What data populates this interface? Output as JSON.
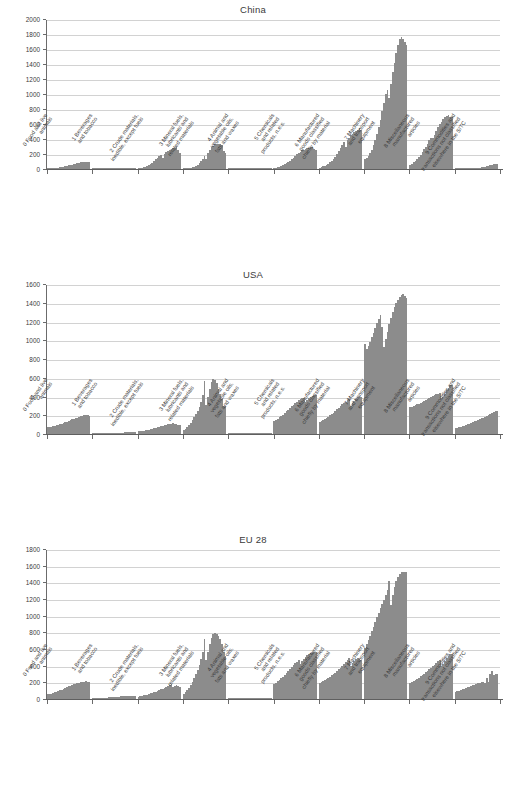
{
  "figure": {
    "bar_color": "#8c8c8c",
    "grid_color": "#d2d2d2",
    "axis_color": "#6b6b6b",
    "text_color": "#3a3a3a"
  },
  "categories": [
    "0 Food and live\nanimals",
    "1 Beverages\nand tobacco",
    "2 Crude materials,\ninedible, except fuels",
    "3 Mineral fuels,\nlubricants and\nrelated materials",
    "4 Animal and\nvegetable oils,\nfats and waxes",
    "5 Chemicals\nand related\nproducts, n.e.s.",
    "6 Manufactured\ngoods classified\nchiefly by material",
    "7 Machinery\nand transport\nequipment",
    "8 Miscellaneous\nmanufactured\narticles",
    "9 Commodities and\ntransactions not classified\nelsewhere in the SITC"
  ],
  "chart_data": [
    {
      "type": "bar",
      "title": "China",
      "xlabel": "",
      "ylabel": "",
      "ylim": [
        0,
        2000
      ],
      "yticks": [
        0,
        200,
        400,
        600,
        800,
        1000,
        1200,
        1400,
        1600,
        1800,
        2000
      ],
      "grid": true,
      "legend": "none",
      "categories": [
        "0 Food and live animals",
        "1 Beverages and tobacco",
        "2 Crude materials, inedible, except fuels",
        "3 Mineral fuels, lubricants and related materials",
        "4 Animal and vegetable oils, fats and waxes",
        "5 Chemicals and related products, n.e.s.",
        "6 Manufactured goods classified chiefly by material",
        "7 Machinery and transport equipment",
        "8 Miscellaneous manufactured articles",
        "9 Commodities and transactions not classified elsewhere in the SITC"
      ],
      "groups": [
        {
          "category": "0 Food and live animals",
          "values": [
            8,
            10,
            12,
            14,
            16,
            18,
            20,
            24,
            28,
            32,
            36,
            42,
            48,
            54,
            60,
            66,
            72,
            78,
            84,
            88,
            92,
            94,
            96,
            94,
            92
          ]
        },
        {
          "category": "1 Beverages and tobacco",
          "values": [
            1,
            1,
            1,
            2,
            2,
            2,
            2,
            3,
            3,
            3,
            4,
            4,
            5,
            5,
            6,
            6,
            7,
            7,
            8,
            8,
            9,
            9,
            10,
            10,
            10
          ]
        },
        {
          "category": "2 Crude materials, inedible, except fuels",
          "values": [
            10,
            14,
            18,
            24,
            30,
            40,
            52,
            66,
            84,
            104,
            128,
            150,
            168,
            190,
            150,
            205,
            230,
            245,
            255,
            265,
            275,
            285,
            290,
            250,
            215
          ]
        },
        {
          "category": "3 Mineral fuels, lubricants and related materials",
          "values": [
            6,
            8,
            10,
            14,
            18,
            24,
            32,
            44,
            60,
            80,
            105,
            135,
            170,
            140,
            215,
            255,
            290,
            310,
            330,
            340,
            335,
            330,
            320,
            240,
            215
          ]
        },
        {
          "category": "4 Animal and vegetable oils, fats and waxes",
          "values": [
            1,
            1,
            1,
            2,
            2,
            2,
            3,
            3,
            4,
            4,
            5,
            6,
            6,
            7,
            8,
            8,
            9,
            10,
            10,
            11,
            11,
            12,
            12,
            11,
            10
          ]
        },
        {
          "category": "5 Chemicals and related products, n.e.s.",
          "values": [
            15,
            20,
            25,
            32,
            40,
            50,
            62,
            76,
            92,
            110,
            130,
            150,
            172,
            195,
            215,
            232,
            248,
            260,
            268,
            275,
            282,
            288,
            292,
            270,
            255
          ]
        },
        {
          "category": "6 Manufactured goods classified chiefly by material",
          "values": [
            20,
            26,
            34,
            44,
            56,
            70,
            88,
            110,
            136,
            166,
            200,
            238,
            278,
            318,
            355,
            300,
            390,
            420,
            450,
            470,
            490,
            505,
            520,
            545,
            520
          ]
        },
        {
          "category": "7 Machinery and transport equipment",
          "values": [
            130,
            150,
            180,
            215,
            260,
            320,
            390,
            470,
            560,
            660,
            770,
            880,
            1000,
            1060,
            950,
            1130,
            1290,
            1420,
            1550,
            1660,
            1730,
            1760,
            1740,
            1700,
            1660
          ]
        },
        {
          "category": "8 Miscellaneous manufactured articles",
          "values": [
            55,
            70,
            90,
            110,
            135,
            162,
            192,
            225,
            262,
            300,
            340,
            382,
            420,
            410,
            460,
            510,
            555,
            595,
            630,
            665,
            690,
            710,
            725,
            700,
            690
          ]
        },
        {
          "category": "9 Commodities and transactions not classified elsewhere in the SITC",
          "values": [
            2,
            2,
            3,
            3,
            4,
            4,
            5,
            6,
            7,
            8,
            10,
            12,
            14,
            17,
            20,
            24,
            28,
            33,
            38,
            44,
            50,
            56,
            62,
            66,
            68
          ]
        }
      ]
    },
    {
      "type": "bar",
      "title": "USA",
      "xlabel": "",
      "ylabel": "",
      "ylim": [
        0,
        1600
      ],
      "yticks": [
        0,
        200,
        400,
        600,
        800,
        1000,
        1200,
        1400,
        1600
      ],
      "grid": true,
      "legend": "none",
      "categories": [
        "0 Food and live animals",
        "1 Beverages and tobacco",
        "2 Crude materials, inedible, except fuels",
        "3 Mineral fuels, lubricants and related materials",
        "4 Animal and vegetable oils, fats and waxes",
        "5 Chemicals and related products, n.e.s.",
        "6 Manufactured goods classified chiefly by material",
        "7 Machinery and transport equipment",
        "8 Miscellaneous manufactured articles",
        "9 Commodities and transactions not classified elsewhere in the SITC"
      ],
      "groups": [
        {
          "category": "0 Food and live animals",
          "values": [
            70,
            75,
            80,
            85,
            90,
            95,
            100,
            105,
            112,
            118,
            125,
            132,
            140,
            148,
            155,
            162,
            168,
            175,
            182,
            190,
            196,
            200,
            205,
            200,
            196
          ]
        },
        {
          "category": "1 Beverages and tobacco",
          "values": [
            4,
            5,
            5,
            6,
            6,
            7,
            7,
            8,
            8,
            9,
            9,
            10,
            11,
            12,
            13,
            14,
            15,
            16,
            17,
            18,
            19,
            20,
            21,
            21,
            22
          ]
        },
        {
          "category": "2 Crude materials, inedible, except fuels",
          "values": [
            28,
            31,
            34,
            37,
            40,
            44,
            48,
            52,
            57,
            62,
            67,
            72,
            78,
            84,
            90,
            95,
            100,
            105,
            108,
            112,
            115,
            112,
            108,
            100,
            95
          ]
        },
        {
          "category": "3 Mineral fuels, lubricants and related materials",
          "values": [
            40,
            55,
            75,
            95,
            120,
            150,
            185,
            215,
            250,
            290,
            340,
            420,
            570,
            310,
            390,
            480,
            560,
            590,
            580,
            540,
            480,
            430,
            370,
            300,
            295
          ]
        },
        {
          "category": "4 Animal and vegetable oils, fats and waxes",
          "values": [
            1,
            1,
            2,
            2,
            2,
            3,
            3,
            3,
            4,
            4,
            5,
            5,
            6,
            6,
            7,
            7,
            8,
            8,
            9,
            9,
            10,
            10,
            10,
            9,
            9
          ]
        },
        {
          "category": "5 Chemicals and related products, n.e.s.",
          "values": [
            140,
            152,
            165,
            178,
            192,
            208,
            224,
            242,
            260,
            278,
            296,
            314,
            330,
            345,
            360,
            372,
            382,
            388,
            345,
            360,
            380,
            395,
            405,
            412,
            418
          ]
        },
        {
          "category": "6 Manufactured goods classified chiefly by material",
          "values": [
            130,
            140,
            150,
            160,
            172,
            184,
            198,
            212,
            228,
            244,
            262,
            280,
            298,
            315,
            330,
            345,
            360,
            372,
            300,
            330,
            355,
            375,
            390,
            400,
            400
          ]
        },
        {
          "category": "7 Machinery and transport equipment",
          "values": [
            960,
            905,
            940,
            980,
            1030,
            1080,
            1130,
            1180,
            1230,
            1270,
            1140,
            930,
            1010,
            1090,
            1170,
            1240,
            1300,
            1350,
            1400,
            1430,
            1460,
            1485,
            1495,
            1470,
            1455
          ]
        },
        {
          "category": "8 Miscellaneous manufactured articles",
          "values": [
            285,
            292,
            300,
            308,
            316,
            324,
            332,
            342,
            352,
            362,
            372,
            382,
            392,
            402,
            412,
            422,
            430,
            438,
            380,
            400,
            430,
            465,
            495,
            520,
            528
          ]
        },
        {
          "category": "9 Commodities and transactions not classified elsewhere in the SITC",
          "values": [
            60,
            65,
            70,
            76,
            82,
            88,
            95,
            102,
            110,
            118,
            126,
            134,
            142,
            150,
            158,
            166,
            175,
            184,
            192,
            200,
            210,
            222,
            232,
            242,
            250
          ]
        }
      ]
    },
    {
      "type": "bar",
      "title": "EU 28",
      "xlabel": "",
      "ylabel": "",
      "ylim": [
        0,
        1800
      ],
      "yticks": [
        0,
        200,
        400,
        600,
        800,
        1000,
        1200,
        1400,
        1600,
        1800
      ],
      "grid": true,
      "legend": "none",
      "categories": [
        "0 Food and live animals",
        "1 Beverages and tobacco",
        "2 Crude materials, inedible, except fuels",
        "3 Mineral fuels, lubricants and related materials",
        "4 Animal and vegetable oils, fats and waxes",
        "5 Chemicals and related products, n.e.s.",
        "6 Manufactured goods classified chiefly by material",
        "7 Machinery and transport equipment",
        "8 Miscellaneous manufactured articles",
        "9 Commodities and transactions not classified elsewhere in the SITC"
      ],
      "groups": [
        {
          "category": "0 Food and live animals",
          "values": [
            55,
            60,
            66,
            72,
            80,
            88,
            96,
            105,
            114,
            124,
            134,
            144,
            152,
            160,
            168,
            176,
            182,
            190,
            196,
            200,
            205,
            210,
            215,
            210,
            208
          ]
        },
        {
          "category": "1 Beverages and tobacco",
          "values": [
            8,
            9,
            10,
            11,
            12,
            13,
            14,
            16,
            17,
            19,
            20,
            22,
            24,
            25,
            27,
            29,
            31,
            33,
            35,
            36,
            38,
            39,
            40,
            40,
            41
          ]
        },
        {
          "category": "2 Crude materials, inedible, except fuels",
          "values": [
            30,
            34,
            38,
            43,
            48,
            54,
            60,
            67,
            74,
            82,
            90,
            98,
            106,
            115,
            125,
            135,
            150,
            160,
            168,
            175,
            140,
            155,
            168,
            160,
            150
          ]
        },
        {
          "category": "3 Mineral fuels, lubricants and related materials",
          "values": [
            60,
            80,
            105,
            135,
            170,
            210,
            255,
            300,
            350,
            410,
            480,
            565,
            720,
            470,
            560,
            660,
            730,
            775,
            790,
            775,
            760,
            720,
            660,
            560,
            520
          ]
        },
        {
          "category": "4 Animal and vegetable oils, fats and waxes",
          "values": [
            2,
            2,
            3,
            3,
            4,
            4,
            5,
            5,
            6,
            6,
            7,
            7,
            8,
            8,
            9,
            10,
            10,
            11,
            12,
            12,
            13,
            14,
            14,
            14,
            14
          ]
        },
        {
          "category": "5 Chemicals and related products, n.e.s.",
          "values": [
            180,
            195,
            212,
            230,
            248,
            268,
            290,
            312,
            335,
            358,
            382,
            405,
            428,
            450,
            470,
            420,
            455,
            480,
            505,
            525,
            540,
            552,
            562,
            565,
            560
          ]
        },
        {
          "category": "6 Manufactured goods classified chiefly by material",
          "values": [
            195,
            205,
            216,
            228,
            240,
            254,
            268,
            284,
            300,
            318,
            336,
            355,
            375,
            395,
            415,
            440,
            465,
            490,
            400,
            435,
            462,
            478,
            488,
            480,
            470
          ]
        },
        {
          "category": "7 Machinery and transport equipment",
          "values": [
            615,
            660,
            710,
            760,
            815,
            870,
            925,
            980,
            1035,
            1090,
            1140,
            1190,
            1250,
            1310,
            1420,
            1130,
            1250,
            1350,
            1420,
            1470,
            1500,
            1520,
            1530,
            1520,
            1525
          ]
        },
        {
          "category": "8 Miscellaneous manufactured articles",
          "values": [
            195,
            205,
            216,
            228,
            242,
            256,
            272,
            288,
            305,
            322,
            340,
            358,
            376,
            394,
            412,
            432,
            452,
            472,
            400,
            425,
            460,
            495,
            520,
            540,
            538
          ]
        },
        {
          "category": "9 Commodities and transactions not classified elsewhere in the SITC",
          "values": [
            85,
            92,
            100,
            108,
            116,
            124,
            132,
            140,
            148,
            156,
            165,
            174,
            182,
            190,
            196,
            200,
            205,
            196,
            250,
            210,
            300,
            335,
            290,
            300,
            305
          ]
        }
      ]
    }
  ]
}
